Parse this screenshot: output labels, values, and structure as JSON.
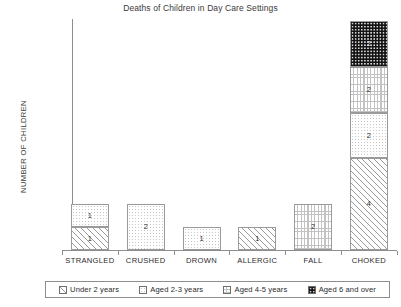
{
  "chart_data": {
    "type": "bar",
    "title": "Deaths of Children in Day Care Settings",
    "subtitle": "",
    "xlabel": "",
    "ylabel": "NUMBER OF CHILDREN",
    "stacked": true,
    "grid": false,
    "legend_position": "bottom",
    "ylim": [
      0,
      10
    ],
    "categories": [
      "STRANGLED",
      "CRUSHED",
      "DROWN",
      "ALLERGIC",
      "FALL",
      "CHOKED"
    ],
    "series": [
      {
        "name": "Under 2 years",
        "pattern": "diagonal-hatch",
        "values": [
          1,
          0,
          0,
          1,
          0,
          4
        ]
      },
      {
        "name": "Aged 2-3 years",
        "pattern": "fine-dots",
        "values": [
          1,
          2,
          1,
          0,
          0,
          2
        ]
      },
      {
        "name": "Aged 4-5 years",
        "pattern": "dashed-brick",
        "values": [
          0,
          0,
          0,
          0,
          2,
          2
        ]
      },
      {
        "name": "Aged 6 and over",
        "pattern": "dark-dots",
        "values": [
          0,
          0,
          0,
          0,
          0,
          2
        ]
      }
    ],
    "totals": [
      2,
      2,
      1,
      1,
      2,
      10
    ],
    "data_labels": [
      {
        "category": "STRANGLED",
        "segments": [
          {
            "series": "Under 2 years",
            "label": "1"
          },
          {
            "series": "Aged 2-3 years",
            "label": "1"
          }
        ]
      },
      {
        "category": "CRUSHED",
        "segments": [
          {
            "series": "Aged 2-3 years",
            "label": "2"
          }
        ]
      },
      {
        "category": "DROWN",
        "segments": [
          {
            "series": "Aged 2-3 years",
            "label": "1"
          }
        ]
      },
      {
        "category": "ALLERGIC",
        "segments": [
          {
            "series": "Under 2 years",
            "label": "1"
          }
        ]
      },
      {
        "category": "FALL",
        "segments": [
          {
            "series": "Aged 4-5 years",
            "label": "2"
          }
        ]
      },
      {
        "category": "CHOKED",
        "segments": [
          {
            "series": "Under 2 years",
            "label": "4"
          },
          {
            "series": "Aged 2-3 years",
            "label": "2"
          },
          {
            "series": "Aged 4-5 years",
            "label": "2"
          },
          {
            "series": "Aged 6 and over",
            "label": "2"
          }
        ]
      }
    ]
  },
  "legend": {
    "items": [
      {
        "label": "Under 2 years"
      },
      {
        "label": "Aged 2-3 years"
      },
      {
        "label": "Aged 4-5 years"
      },
      {
        "label": "Aged 6 and over"
      }
    ]
  },
  "colors": {
    "axis": "#8d8d8d",
    "text": "#2b2b2b",
    "bar_outline": "#9a9a9a",
    "dark_fill": "#131313",
    "background": "#ffffff"
  }
}
